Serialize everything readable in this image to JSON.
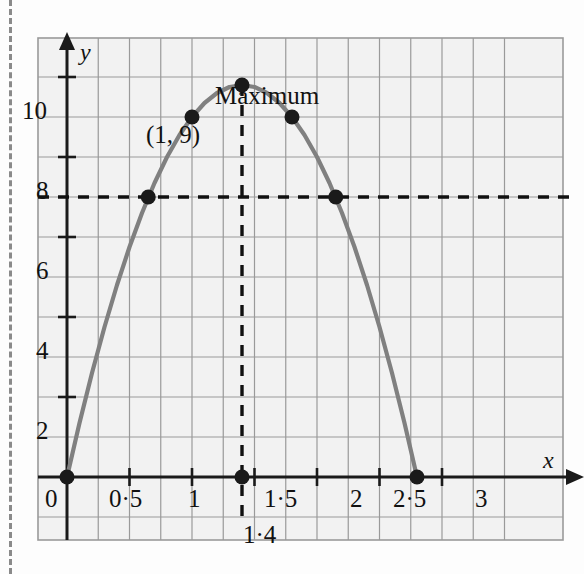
{
  "figure": {
    "background_color": "#fdfdfd",
    "plot_background_color": "#f2f2f2",
    "grid_color": "#9a9a9a",
    "axis_color": "#1a1a1a",
    "curve_color": "#808080",
    "point_color": "#1a1a1a",
    "dash_color": "#111111"
  },
  "axes": {
    "x_axis_name": "x",
    "y_axis_name": "y",
    "x_tick_labels": [
      "0",
      "0·5",
      "1",
      "1·5",
      "2",
      "2·5",
      "3"
    ],
    "x_tick_values": [
      0,
      0.5,
      1,
      1.5,
      2,
      2.5,
      3
    ],
    "y_tick_labels": [
      "2",
      "4",
      "6",
      "8",
      "10"
    ],
    "y_tick_values": [
      2,
      4,
      6,
      8,
      10
    ]
  },
  "annotations": {
    "maximum_label": "Maximum",
    "point_label": "(1, 9)",
    "x_value_label": "1·4"
  },
  "chart_data": {
    "type": "line",
    "title": "",
    "subtitle": "",
    "xlabel": "x",
    "ylabel": "y",
    "xlim": [
      -0.25,
      3.5
    ],
    "ylim": [
      -1.25,
      11.5
    ],
    "grid": true,
    "grid_x_step": 0.25,
    "grid_y_step": 1,
    "legend": "none",
    "curve": {
      "name": "quadratic",
      "equation_form": "y = a*x*(x - 2.8)",
      "vertex": [
        1.4,
        9.8
      ],
      "roots": [
        0,
        2.8
      ],
      "x": [
        0,
        0.1,
        0.2,
        0.3,
        0.4,
        0.5,
        0.6,
        0.7,
        0.8,
        0.9,
        1,
        1.1,
        1.2,
        1.3,
        1.4,
        1.5,
        1.6,
        1.7,
        1.8,
        1.9,
        2,
        2.1,
        2.2,
        2.3,
        2.4,
        2.5,
        2.6,
        2.7,
        2.8
      ],
      "y": [
        0,
        1.35,
        2.6,
        3.75,
        4.8,
        5.75,
        6.6,
        7.35,
        8.0,
        8.55,
        9.0,
        9.35,
        9.6,
        9.75,
        9.8,
        9.75,
        9.6,
        9.35,
        9.0,
        8.55,
        8.0,
        7.35,
        6.6,
        5.75,
        4.8,
        3.75,
        2.6,
        1.35,
        0
      ]
    },
    "marked_points": [
      {
        "label": "origin",
        "x": 0,
        "y": 0
      },
      {
        "label": "left-at-7",
        "x": 0.65,
        "y": 7
      },
      {
        "label": "(1, 9)",
        "x": 1,
        "y": 9
      },
      {
        "label": "maximum",
        "x": 1.4,
        "y": 9.8
      },
      {
        "label": "right-at-9",
        "x": 1.8,
        "y": 9
      },
      {
        "label": "right-at-7",
        "x": 2.15,
        "y": 7
      },
      {
        "label": "x-axis-root",
        "x": 2.8,
        "y": 0
      },
      {
        "label": "foot-of-maximum",
        "x": 1.4,
        "y": 0
      }
    ],
    "reference_lines": [
      {
        "orientation": "horizontal",
        "value": 7,
        "style": "dashed"
      },
      {
        "orientation": "vertical",
        "value": 1.4,
        "style": "dashed"
      }
    ]
  }
}
